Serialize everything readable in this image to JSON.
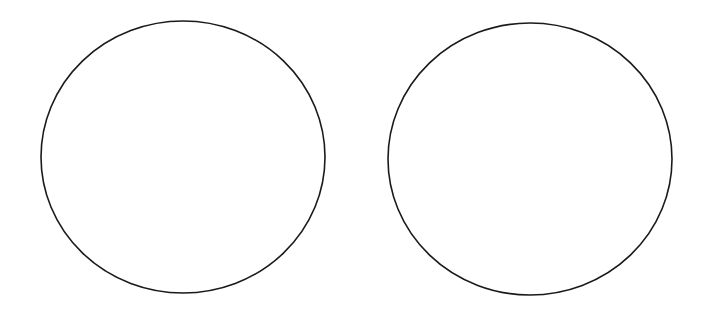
{
  "diagram": {
    "background": "#ffffff",
    "stroke_color": "#1a1a1a",
    "stroke_width": 1.6,
    "shapes": [
      {
        "type": "ellipse",
        "name": "left-circle",
        "cx": 183,
        "cy": 157,
        "rx": 142,
        "ry": 136
      },
      {
        "type": "ellipse",
        "name": "right-circle",
        "cx": 530,
        "cy": 159,
        "rx": 142,
        "ry": 136
      }
    ]
  }
}
